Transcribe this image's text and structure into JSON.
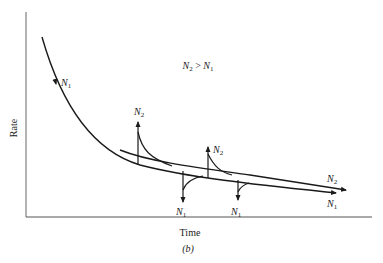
{
  "figure": {
    "caption": "(b)",
    "x_axis_label": "Time",
    "y_axis_label": "Rate",
    "condition_label": {
      "left": "N",
      "left_sub": "2",
      "op": " > ",
      "right": "N",
      "right_sub": "1"
    },
    "curve_labels": {
      "n1_start": {
        "base": "N",
        "sub": "1"
      },
      "n2_end": {
        "base": "N",
        "sub": "2"
      },
      "n1_end": {
        "base": "N",
        "sub": "1"
      }
    },
    "step_labels": [
      {
        "base": "N",
        "sub": "2",
        "direction": "up"
      },
      {
        "base": "N",
        "sub": "1",
        "direction": "down"
      },
      {
        "base": "N",
        "sub": "2",
        "direction": "up"
      },
      {
        "base": "N",
        "sub": "1",
        "direction": "down"
      }
    ],
    "colors": {
      "line": "#1a1a1a",
      "axis": "#555555",
      "background": "#ffffff"
    }
  }
}
